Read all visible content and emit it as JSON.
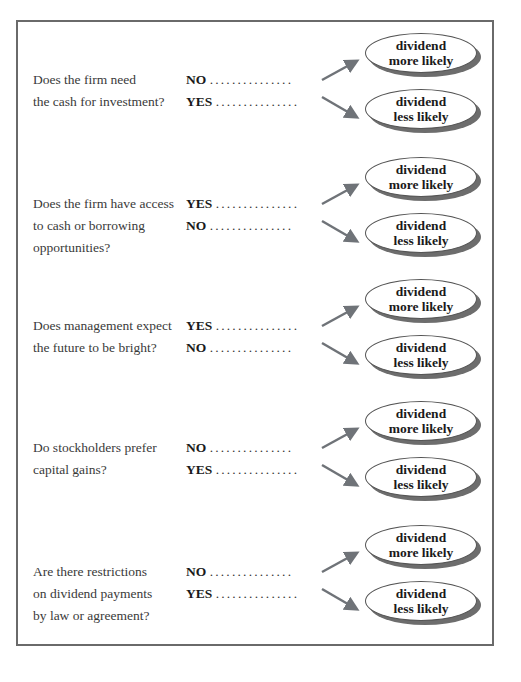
{
  "diagram": {
    "outcome_more": [
      "dividend",
      "more likely"
    ],
    "outcome_less": [
      "dividend",
      "less likely"
    ],
    "dots": "...............",
    "rows": [
      {
        "question": [
          "Does the firm need",
          "the cash for investment?"
        ],
        "answer_top": "NO",
        "answer_bottom": "YES"
      },
      {
        "question": [
          "Does the firm have access",
          "to cash or borrowing",
          "opportunities?"
        ],
        "answer_top": "YES",
        "answer_bottom": "NO"
      },
      {
        "question": [
          "Does management expect",
          "the future to be bright?"
        ],
        "answer_top": "YES",
        "answer_bottom": "NO"
      },
      {
        "question": [
          "Do stockholders prefer",
          "capital gains?"
        ],
        "answer_top": "NO",
        "answer_bottom": "YES"
      },
      {
        "question": [
          "Are there restrictions",
          "on dividend payments",
          "by law or agreement?"
        ],
        "answer_top": "NO",
        "answer_bottom": "YES"
      }
    ],
    "colors": {
      "frame": "#6a6a6a",
      "arrow": "#6f7378",
      "oval_shadow": "#6d6d6d"
    }
  }
}
